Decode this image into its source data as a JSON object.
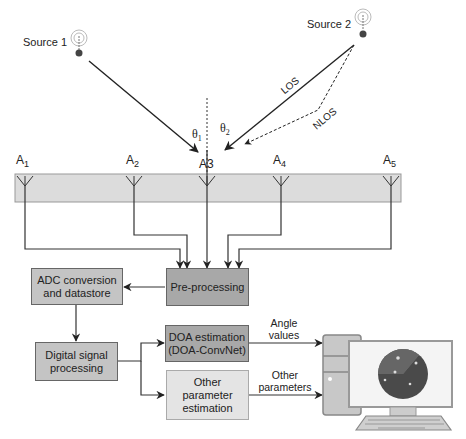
{
  "sources": [
    {
      "label": "Source 1"
    },
    {
      "label": "Source 2"
    }
  ],
  "paths": {
    "los": "LOS",
    "nlos": "NLOS"
  },
  "angles": [
    {
      "symbol": "θ",
      "sub": "1"
    },
    {
      "symbol": "θ",
      "sub": "2"
    }
  ],
  "antennas": [
    {
      "letter": "A",
      "sub": "1"
    },
    {
      "letter": "A",
      "sub": "2"
    },
    {
      "letter": "A",
      "sub": "3"
    },
    {
      "letter": "A",
      "sub": "4"
    },
    {
      "letter": "A",
      "sub": "5"
    }
  ],
  "blocks": {
    "preprocessing": "Pre-processing",
    "adc": "ADC conversion and datastore",
    "dsp": "Digital signal processing",
    "doa": "DOA estimation (DOA-ConvNet)",
    "other": "Other parameter estimation"
  },
  "outputs": {
    "angle": "Angle values",
    "other": "Other parameters"
  },
  "colors": {
    "dark_block": "#a8a8a8",
    "mid_block": "#c4c4c4",
    "light_block": "#e4e4e4",
    "array_bar": "#dcdcdc",
    "line": "#333333"
  }
}
